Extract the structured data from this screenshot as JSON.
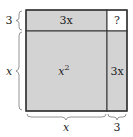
{
  "diagram": {
    "type": "completing-the-square",
    "colors": {
      "fill": "#d3d3d3",
      "unknown_fill": "#ffffff",
      "stroke": "#333333"
    },
    "regions": {
      "big_square": {
        "label": "x",
        "sup": "2"
      },
      "top_strip": {
        "label": "3x"
      },
      "right_strip": {
        "label": "3x"
      },
      "corner": {
        "label": "?"
      }
    },
    "braces": {
      "left_top": {
        "label": "3"
      },
      "left_bottom": {
        "label": "x"
      },
      "bottom_left": {
        "label": "x"
      },
      "bottom_right": {
        "label": "3"
      }
    }
  }
}
